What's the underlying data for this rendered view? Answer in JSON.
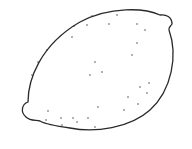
{
  "illustration": {
    "subject": "lemon",
    "style": "line-drawing",
    "stroke_color": "#2a2a2a",
    "fill_color": "#ffffff",
    "dots": [
      [
        92,
        16
      ],
      [
        117,
        15
      ],
      [
        74,
        26
      ],
      [
        87,
        25
      ],
      [
        109,
        24
      ],
      [
        137,
        24
      ],
      [
        145,
        30
      ],
      [
        72,
        37
      ],
      [
        137,
        43
      ],
      [
        47,
        50
      ],
      [
        132,
        55
      ],
      [
        38,
        62
      ],
      [
        95,
        62
      ],
      [
        102,
        72
      ],
      [
        90,
        75
      ],
      [
        32,
        75
      ],
      [
        149,
        83
      ],
      [
        140,
        87
      ],
      [
        147,
        93
      ],
      [
        128,
        97
      ],
      [
        98,
        107
      ],
      [
        138,
        104
      ],
      [
        124,
        110
      ],
      [
        48,
        111
      ],
      [
        46,
        120
      ],
      [
        61,
        118
      ],
      [
        73,
        118
      ],
      [
        88,
        118
      ],
      [
        62,
        125
      ],
      [
        77,
        122
      ],
      [
        95,
        127
      ]
    ]
  }
}
